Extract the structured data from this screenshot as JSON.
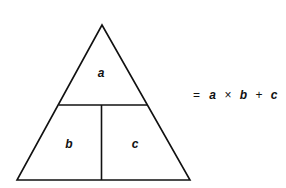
{
  "diagram": {
    "type": "formula-triangle",
    "sections": {
      "top": "a",
      "bottom_left": "b",
      "bottom_right": "c"
    },
    "formula": {
      "equals": "=",
      "term1": "a",
      "times": "×",
      "term2": "b",
      "plus": "+",
      "term3": "c"
    },
    "colors": {
      "stroke": "#111111",
      "background": "#ffffff"
    }
  }
}
